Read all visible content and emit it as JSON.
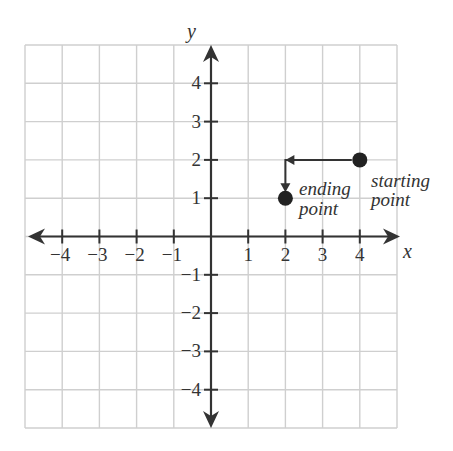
{
  "diagram": {
    "type": "coordinate-plane",
    "x_axis_label": "x",
    "y_axis_label": "y",
    "x_ticks": [
      "−4",
      "−3",
      "−2",
      "−1",
      "1",
      "2",
      "3",
      "4"
    ],
    "y_ticks": [
      "4",
      "3",
      "2",
      "1",
      "−1",
      "−2",
      "−3",
      "−4"
    ],
    "range": [
      -5,
      5
    ],
    "points": [
      {
        "name": "starting point",
        "x": 4,
        "y": 2,
        "label_line1": "starting",
        "label_line2": "point"
      },
      {
        "name": "ending point",
        "x": 2,
        "y": 1,
        "label_line1": "ending",
        "label_line2": "point"
      }
    ],
    "path": [
      {
        "x": 4,
        "y": 2
      },
      {
        "x": 2,
        "y": 2
      },
      {
        "x": 2,
        "y": 1
      }
    ],
    "colors": {
      "grid": "#cfcfcf",
      "axis": "#333333",
      "point": "#222222"
    }
  }
}
